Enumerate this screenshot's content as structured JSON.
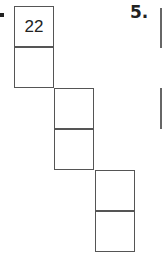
{
  "problem_prev": {
    "boxes": [
      "22",
      "",
      "",
      "",
      "",
      ""
    ]
  },
  "problem_next": {
    "number": "5."
  }
}
